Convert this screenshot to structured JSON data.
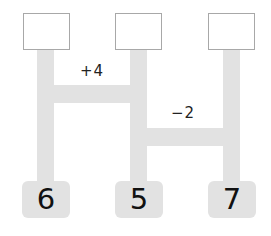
{
  "diagram": {
    "type": "ladder-puzzle",
    "colors": {
      "bar": "#e2e2e2",
      "box_border": "#a8a8a8",
      "text": "#111111"
    },
    "top_boxes": [
      {
        "label": ""
      },
      {
        "label": ""
      },
      {
        "label": ""
      }
    ],
    "bottom_boxes": [
      {
        "label": "6"
      },
      {
        "label": "5"
      },
      {
        "label": "7"
      }
    ],
    "rungs": [
      {
        "between": [
          1,
          2
        ],
        "operation": "+4"
      },
      {
        "between": [
          2,
          3
        ],
        "operation": "−2"
      }
    ]
  }
}
